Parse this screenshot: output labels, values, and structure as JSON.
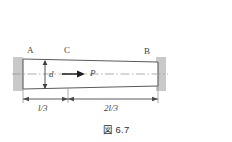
{
  "figure": {
    "caption": "図 6.7",
    "points": {
      "left_label": "A",
      "mid_label": "C",
      "right_label": "B"
    },
    "annotations": {
      "diameter_label": "d",
      "force_label": "P"
    },
    "dimensions": [
      {
        "label": "l/3"
      },
      {
        "label": "2l/3"
      }
    ],
    "colors": {
      "line": "#5a5a5a",
      "support_fill": "#c9c9c9",
      "centerline": "#9a9a9a",
      "text": "#3a3a3a",
      "background": "#ffffff"
    }
  }
}
